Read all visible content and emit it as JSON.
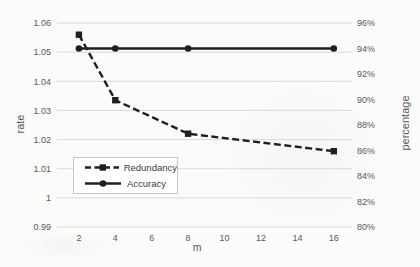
{
  "chart_data": {
    "type": "line",
    "x_axis": {
      "label": "m",
      "tick_values": [
        2,
        4,
        6,
        8,
        10,
        12,
        14,
        16
      ],
      "tick_labels": [
        "2",
        "4",
        "6",
        "8",
        "10",
        "12",
        "14",
        "16"
      ],
      "range": [
        2,
        16
      ]
    },
    "left_axis": {
      "label": "rate",
      "min": 0.99,
      "max": 1.06,
      "tick_values": [
        1.06,
        1.05,
        1.04,
        1.03,
        1.02,
        1.01,
        1,
        0.99
      ],
      "tick_labels": [
        "1.06",
        "1.05",
        "1.04",
        "1.03",
        "1.02",
        "1.01",
        "1",
        "0.99"
      ],
      "gridlines": true
    },
    "right_axis": {
      "label": "percentage",
      "min": 80,
      "max": 96,
      "tick_values": [
        96,
        94,
        92,
        90,
        88,
        86,
        84,
        82,
        80
      ],
      "tick_labels": [
        "96%",
        "94%",
        "92%",
        "90%",
        "88%",
        "86%",
        "84%",
        "82%",
        "80%"
      ],
      "gridlines": false
    },
    "series": [
      {
        "name": "Redundancy",
        "axis": "left",
        "line_style": "dashed",
        "marker": "square",
        "color": "#1f1f1f",
        "x": [
          2,
          4,
          8,
          16
        ],
        "values": [
          1.056,
          1.0335,
          1.022,
          1.016
        ]
      },
      {
        "name": "Accuracy",
        "axis": "right",
        "line_style": "solid",
        "marker": "circle",
        "color": "#1f1f1f",
        "x": [
          2,
          4,
          8,
          16
        ],
        "values": [
          94,
          94,
          94,
          94
        ]
      }
    ],
    "legend_position": "inside lower-left",
    "grid": "horizontal at left-axis ticks",
    "colors": {
      "line": "#1f1f1f",
      "tick_text": "#595959",
      "gridline": "#d9d9d5",
      "legend_border": "#c6c6c2",
      "background": "#fbfbf9"
    }
  }
}
